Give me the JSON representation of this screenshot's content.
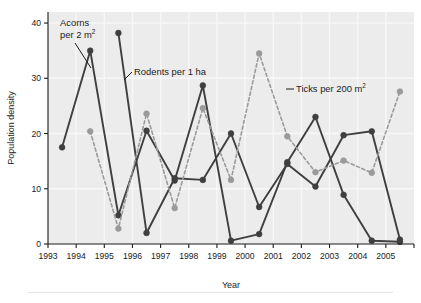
{
  "figure": {
    "background": "#ececec",
    "page_background": "#ffffff"
  },
  "axes": {
    "xlabel": "Year",
    "ylabel": "Population density",
    "x_ticks": [
      "1993",
      "1994",
      "1995",
      "1996",
      "1997",
      "1998",
      "1999",
      "2000",
      "2001",
      "2002",
      "2003",
      "2004",
      "2005"
    ],
    "y_ticks": [
      "0",
      "10",
      "20",
      "30",
      "40"
    ]
  },
  "annotations": {
    "acorns": {
      "line1": "Acorns",
      "line2": "per 2 m",
      "sup2": "2"
    },
    "rodents": {
      "text": "Rodents per 1 ha"
    },
    "ticks": {
      "text": "Ticks per 200 m",
      "sup2": "2"
    }
  },
  "colors": {
    "acorns": "#3f3f3f",
    "rodents": "#3f3f3f",
    "ticks": "#9a9a9a",
    "plot_background": "#ececec",
    "gridline": "#f7f7f7",
    "axis": "#1b1b1b"
  },
  "chart_data": {
    "type": "line",
    "title": "",
    "xlabel": "Year",
    "ylabel": "Population density",
    "xlim": [
      1993,
      2006
    ],
    "ylim": [
      0,
      42
    ],
    "yticks": [
      0,
      10,
      20,
      30,
      40
    ],
    "xticks": [
      1993,
      1994,
      1995,
      1996,
      1997,
      1998,
      1999,
      2000,
      2001,
      2002,
      2003,
      2004,
      2005
    ],
    "grid": true,
    "legend": "inline-annotations",
    "x": [
      1993.5,
      1994.5,
      1995.5,
      1996.5,
      1997.5,
      1998.5,
      1999.5,
      2000.5,
      2001.5,
      2002.5,
      2003.5,
      2004.5,
      2005.5
    ],
    "series": [
      {
        "name": "Acorns per 2 m2",
        "label": "Acorns per 2 m²",
        "color": "#3f3f3f",
        "linestyle": "solid",
        "marker": "circle",
        "values": [
          17.5,
          35.0,
          5.2,
          20.5,
          11.5,
          28.7,
          0.6,
          1.8,
          14.8,
          23.0,
          8.9,
          0.6,
          0.4
        ]
      },
      {
        "name": "Rodents per 1 ha",
        "label": "Rodents per 1 ha",
        "color": "#3f3f3f",
        "linestyle": "solid",
        "marker": "circle",
        "values": [
          null,
          null,
          38.2,
          2.0,
          11.9,
          11.6,
          20.0,
          6.7,
          14.5,
          10.4,
          19.7,
          20.4,
          0.8
        ]
      },
      {
        "name": "Ticks per 200 m2",
        "label": "Ticks per 200 m²",
        "color": "#9a9a9a",
        "linestyle": "dashed",
        "marker": "circle",
        "values": [
          null,
          20.4,
          2.8,
          23.6,
          6.5,
          24.6,
          11.6,
          34.5,
          19.5,
          13.0,
          15.1,
          12.9,
          27.6
        ]
      }
    ]
  }
}
